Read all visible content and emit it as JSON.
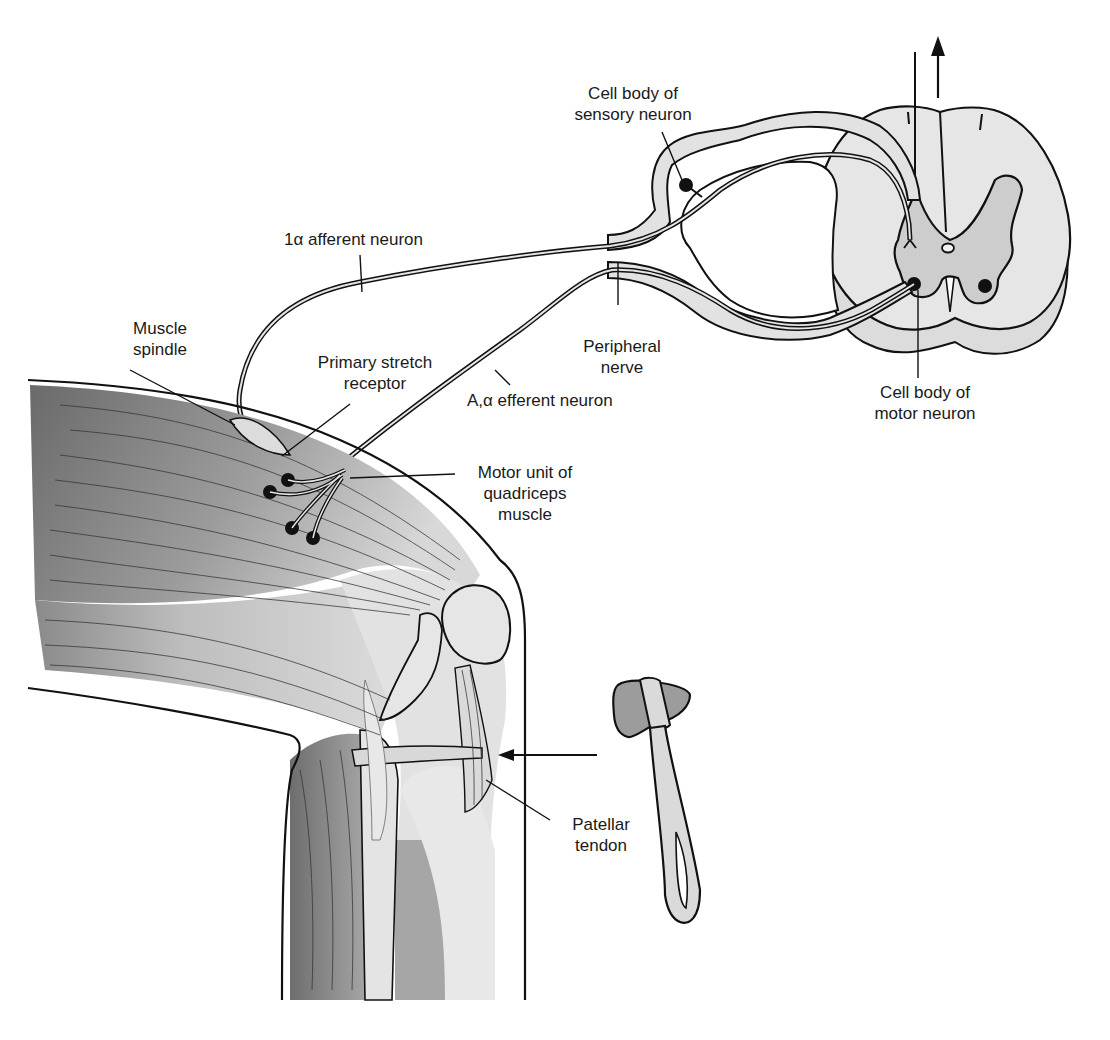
{
  "labels": {
    "cell_body_sensory": "Cell body of\nsensory neuron",
    "afferent": "1α afferent neuron",
    "muscle_spindle": "Muscle\nspindle",
    "primary_stretch": "Primary stretch\nreceptor",
    "peripheral_nerve": "Peripheral\nnerve",
    "efferent": "A,α efferent neuron",
    "cell_body_motor": "Cell body of\nmotor neuron",
    "motor_unit": "Motor unit of\nquadriceps\nmuscle",
    "patellar_tendon": "Patellar\ntendon"
  },
  "colors": {
    "outline": "#111111",
    "spinal_white": "#e8e8e8",
    "spinal_grey": "#cfcfcf",
    "muscle_dark": "#6e6e6e",
    "muscle_light": "#d6d6d6",
    "hammer_head": "#9a9a9a",
    "hammer_handle": "#dadada"
  },
  "icons": [
    "upward-arrow-icon",
    "reflex-hammer-icon",
    "stimulus-arrow-icon"
  ]
}
